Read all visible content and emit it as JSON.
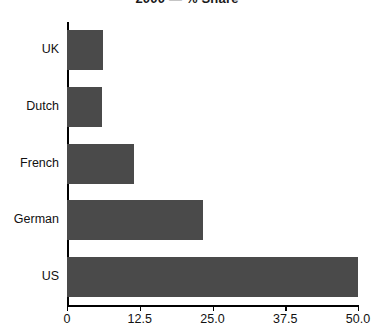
{
  "chart_data": {
    "type": "bar",
    "orientation": "horizontal",
    "title": "2000 — % Share",
    "xlabel": "",
    "ylabel": "",
    "categories": [
      "UK",
      "Dutch",
      "French",
      "German",
      "US"
    ],
    "values": [
      6.2,
      6.0,
      11.5,
      23.3,
      50.0
    ],
    "series": [
      {
        "name": "% Share",
        "values": [
          6.2,
          6.0,
          11.5,
          23.3,
          50.0
        ]
      }
    ],
    "xlim": [
      0,
      50
    ],
    "xticks": [
      0,
      12.5,
      25.0,
      37.5,
      50.0
    ],
    "xtick_labels": [
      "0",
      "12.5",
      "25.0",
      "37.5",
      "50.0"
    ],
    "grid": false,
    "legend": false,
    "bar_color": "#4a4a4a",
    "axis_color": "#000000",
    "background": "#ffffff"
  }
}
